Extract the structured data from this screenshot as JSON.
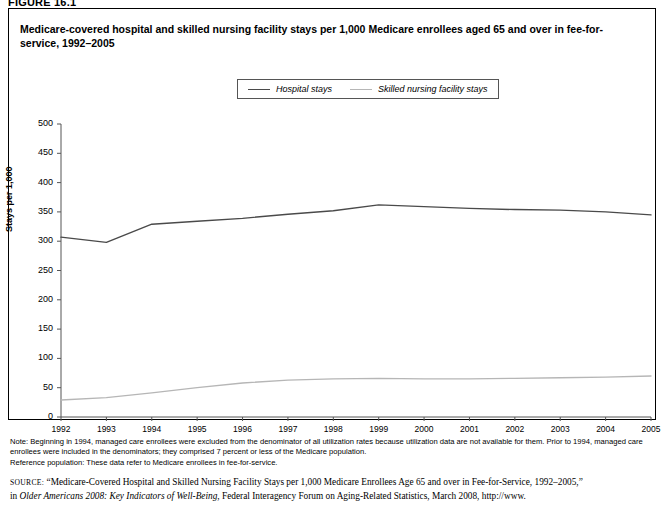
{
  "figure": {
    "label": "FIGURE 16.1"
  },
  "title": "Medicare-covered hospital and skilled nursing facility stays per 1,000 Medicare enrollees aged 65 and over in fee-for-service, 1992–2005",
  "legend": {
    "position": "top-center",
    "items": [
      {
        "label": "Hospital stays",
        "color": "#4a4a4a"
      },
      {
        "label": "Skilled nursing facility stays",
        "color": "#b6b6b6"
      }
    ]
  },
  "notes": {
    "note": "Note: Beginning in 1994, managed care enrollees were excluded from the denominator of all utilization rates because utilization data are not available for them. Prior to 1994, managed care enrollees were included in the denominators; they comprised 7 percent or less of the Medicare population.",
    "reference": "Reference population: These data refer to Medicare enrollees in fee-for-service."
  },
  "source": {
    "label": "SOURCE:",
    "quoted": "“Medicare-Covered Hospital and Skilled Nursing Facility Stays per 1,000 Medicare Enrollees Age 65 and over in Fee-for-Service, 1992–2005,”",
    "in_word": "in",
    "italic_work": "Older Americans 2008: Key Indicators of Well-Being",
    "tail": ", Federal Interagency Forum on Aging-Related Statistics, March 2008, http://www."
  },
  "chart_data": {
    "type": "line",
    "title": "Medicare-covered hospital and skilled nursing facility stays per 1,000 Medicare enrollees aged 65 and over in fee-for-service, 1992–2005",
    "xlabel": "",
    "ylabel": "Stays per 1,000",
    "grid": false,
    "ylim": [
      0,
      500
    ],
    "yticks": [
      0,
      50,
      100,
      150,
      200,
      250,
      300,
      350,
      400,
      450,
      500
    ],
    "ytick_labels": [
      "0",
      "50",
      "100",
      "150",
      "200",
      "250",
      "300",
      "350",
      "400",
      "450",
      "500"
    ],
    "x": [
      1992,
      1993,
      1994,
      1995,
      1996,
      1997,
      1998,
      1999,
      2000,
      2001,
      2002,
      2003,
      2004,
      2005
    ],
    "xtick_labels": [
      "1992",
      "1993",
      "1994",
      "1995",
      "1996",
      "1997",
      "1998",
      "1999",
      "2000",
      "2001",
      "2002",
      "2003",
      "2004",
      "2005"
    ],
    "series": [
      {
        "name": "Hospital stays",
        "color": "#4a4a4a",
        "values": [
          307,
          298,
          329,
          334,
          339,
          346,
          352,
          362,
          359,
          356,
          354,
          353,
          350,
          345
        ]
      },
      {
        "name": "Skilled nursing facility stays",
        "color": "#b6b6b6",
        "values": [
          29,
          33,
          41,
          50,
          58,
          63,
          65,
          66,
          65,
          65,
          66,
          67,
          68,
          70
        ]
      }
    ]
  }
}
